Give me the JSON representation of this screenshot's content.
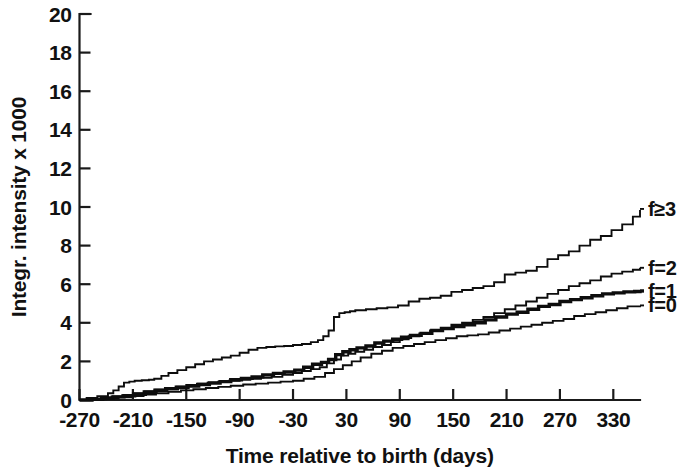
{
  "chart_data": {
    "type": "line",
    "title": "",
    "xlabel": "Time relative to birth (days)",
    "ylabel": "Integr. intensity x 1000",
    "xlim": [
      -270,
      360
    ],
    "ylim": [
      0,
      20
    ],
    "xticks": [
      -270,
      -210,
      -150,
      -90,
      -30,
      30,
      90,
      150,
      210,
      270,
      330
    ],
    "xtick_labels": [
      "-270",
      "-210",
      "-150",
      "-90",
      "-30",
      "30",
      "90",
      "150",
      "210",
      "270",
      "330"
    ],
    "yticks": [
      0,
      2,
      4,
      6,
      8,
      10,
      12,
      14,
      16,
      18,
      20
    ],
    "ytick_labels": [
      "0",
      "2",
      "4",
      "6",
      "8",
      "10",
      "12",
      "14",
      "16",
      "18",
      "20"
    ],
    "grid": false,
    "legend_position": "right-inline",
    "step_style": "post",
    "series": [
      {
        "name": "f>=3",
        "label": "f≥3",
        "line_weight": "thin",
        "label_y_value": 9.9,
        "x": [
          -270,
          -262,
          -250,
          -238,
          -232,
          -226,
          -220,
          -214,
          -208,
          -200,
          -192,
          -186,
          -178,
          -170,
          -160,
          -150,
          -140,
          -130,
          -120,
          -110,
          -100,
          -90,
          -80,
          -70,
          -60,
          -50,
          -40,
          -30,
          -20,
          -10,
          -2,
          4,
          10,
          16,
          22,
          28,
          34,
          40,
          52,
          64,
          76,
          88,
          100,
          112,
          124,
          136,
          148,
          160,
          172,
          184,
          196,
          208,
          220,
          232,
          244,
          256,
          268,
          280,
          292,
          304,
          316,
          328,
          340,
          352,
          360
        ],
        "y": [
          0.0,
          0.1,
          0.2,
          0.35,
          0.5,
          0.7,
          0.9,
          0.95,
          1.0,
          1.02,
          1.05,
          1.1,
          1.25,
          1.4,
          1.55,
          1.7,
          1.85,
          2.0,
          2.1,
          2.2,
          2.3,
          2.45,
          2.6,
          2.7,
          2.75,
          2.78,
          2.8,
          2.85,
          2.9,
          3.0,
          3.1,
          3.3,
          3.6,
          4.3,
          4.5,
          4.55,
          4.6,
          4.65,
          4.7,
          4.75,
          4.8,
          4.9,
          5.1,
          5.25,
          5.3,
          5.4,
          5.6,
          5.7,
          5.8,
          5.9,
          6.1,
          6.5,
          6.6,
          6.7,
          6.9,
          7.3,
          7.5,
          7.7,
          8.0,
          8.3,
          8.5,
          8.8,
          9.1,
          9.5,
          9.85
        ]
      },
      {
        "name": "f=2",
        "label": "f=2",
        "line_weight": "thin",
        "label_y_value": 6.85,
        "x": [
          -270,
          -258,
          -246,
          -234,
          -222,
          -210,
          -198,
          -186,
          -174,
          -162,
          -150,
          -138,
          -126,
          -114,
          -102,
          -90,
          -78,
          -66,
          -54,
          -42,
          -30,
          -20,
          -10,
          0,
          8,
          16,
          24,
          32,
          40,
          50,
          60,
          70,
          80,
          90,
          100,
          112,
          124,
          136,
          148,
          160,
          172,
          184,
          196,
          208,
          220,
          232,
          244,
          256,
          268,
          280,
          292,
          304,
          316,
          328,
          340,
          352,
          360
        ],
        "y": [
          0.0,
          0.05,
          0.1,
          0.18,
          0.25,
          0.35,
          0.45,
          0.55,
          0.62,
          0.7,
          0.78,
          0.85,
          0.9,
          0.95,
          1.0,
          1.05,
          1.1,
          1.15,
          1.2,
          1.3,
          1.4,
          1.5,
          1.6,
          1.7,
          1.9,
          2.1,
          2.3,
          2.4,
          2.5,
          2.6,
          2.75,
          2.85,
          3.0,
          3.15,
          3.3,
          3.45,
          3.6,
          3.75,
          3.9,
          4.0,
          4.15,
          4.3,
          4.5,
          4.7,
          4.9,
          5.1,
          5.3,
          5.5,
          5.7,
          5.9,
          6.05,
          6.2,
          6.4,
          6.55,
          6.65,
          6.75,
          6.85
        ]
      },
      {
        "name": "f=1",
        "label": "f=1",
        "line_weight": "thick",
        "label_y_value": 5.65,
        "x": [
          -270,
          -256,
          -244,
          -232,
          -220,
          -208,
          -196,
          -184,
          -172,
          -160,
          -148,
          -136,
          -124,
          -112,
          -100,
          -88,
          -76,
          -64,
          -52,
          -40,
          -28,
          -18,
          -8,
          2,
          10,
          18,
          26,
          34,
          42,
          52,
          62,
          72,
          82,
          92,
          102,
          114,
          126,
          138,
          150,
          162,
          174,
          186,
          198,
          210,
          222,
          234,
          246,
          258,
          270,
          282,
          294,
          306,
          318,
          330,
          342,
          354,
          360
        ],
        "y": [
          0.0,
          0.04,
          0.1,
          0.16,
          0.22,
          0.3,
          0.4,
          0.5,
          0.58,
          0.65,
          0.72,
          0.8,
          0.88,
          0.95,
          1.05,
          1.12,
          1.2,
          1.3,
          1.38,
          1.45,
          1.55,
          1.7,
          1.85,
          1.95,
          2.1,
          2.35,
          2.5,
          2.6,
          2.7,
          2.8,
          2.95,
          3.05,
          3.15,
          3.25,
          3.35,
          3.45,
          3.6,
          3.7,
          3.8,
          3.9,
          4.0,
          4.15,
          4.3,
          4.45,
          4.55,
          4.7,
          4.85,
          4.95,
          5.1,
          5.2,
          5.3,
          5.4,
          5.5,
          5.55,
          5.6,
          5.62,
          5.65
        ]
      },
      {
        "name": "f=0",
        "label": "f=0",
        "line_weight": "thin",
        "label_y_value": 4.9,
        "x": [
          -270,
          -256,
          -240,
          -226,
          -212,
          -198,
          -184,
          -170,
          -156,
          -142,
          -128,
          -114,
          -100,
          -86,
          -72,
          -58,
          -44,
          -30,
          -18,
          -6,
          6,
          16,
          26,
          36,
          46,
          58,
          70,
          82,
          94,
          106,
          118,
          130,
          142,
          154,
          166,
          178,
          190,
          202,
          214,
          226,
          238,
          250,
          262,
          274,
          286,
          298,
          310,
          322,
          334,
          346,
          360
        ],
        "y": [
          0.0,
          0.03,
          0.08,
          0.14,
          0.2,
          0.28,
          0.35,
          0.42,
          0.5,
          0.56,
          0.62,
          0.68,
          0.74,
          0.8,
          0.85,
          0.9,
          0.95,
          1.0,
          1.1,
          1.2,
          1.4,
          1.6,
          1.8,
          2.0,
          2.2,
          2.4,
          2.55,
          2.7,
          2.8,
          2.9,
          3.0,
          3.1,
          3.2,
          3.3,
          3.35,
          3.4,
          3.5,
          3.6,
          3.7,
          3.8,
          3.9,
          4.0,
          4.1,
          4.2,
          4.35,
          4.45,
          4.55,
          4.65,
          4.75,
          4.85,
          4.9
        ]
      }
    ]
  },
  "colors": {
    "ink": "#0d0d0d",
    "background": "#ffffff"
  }
}
